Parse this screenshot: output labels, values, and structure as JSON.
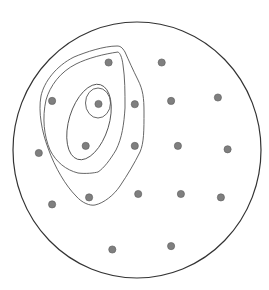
{
  "diagram": {
    "type": "topographic-contour-map",
    "background": "#ffffff",
    "boundary": {
      "shape": "ellipse",
      "cx": 137,
      "cy": 150,
      "rx": 124,
      "ry": 128,
      "stroke": "#333333"
    },
    "contour_color": "#555555",
    "contours": [
      {
        "level": 1,
        "path": "M117,46 C104,46 86,52 74,57 C56,66 44,82 41,96 C38,112 42,132 48,148 C55,168 66,186 76,196 C82,203 90,206 95,205 C104,203 114,195 120,186 C128,174 134,164 140,152 C144,143 144,130 144,112 C144,98 143,90 138,80 C133,70 129,61 125,52 C122,47 120,46 117,46 Z"
      },
      {
        "level": 2,
        "path": "M118,52 C104,54 88,58 76,64 C60,72 50,86 46,100 C42,118 44,136 50,150 C56,162 66,170 78,173 C86,174 94,173 98,172 C104,168 110,160 116,150 C122,138 124,124 125,108 C125,92 125,78 123,65 C122,57 120,53 118,52 Z"
      },
      {
        "level": 3,
        "ellipse": {
          "cx": 89,
          "cy": 122,
          "rx": 20,
          "ry": 39,
          "rotate": 17
        }
      },
      {
        "level": 4,
        "ellipse": {
          "cx": 98,
          "cy": 103,
          "rx": 12.5,
          "ry": 15,
          "rotate": 0
        }
      }
    ],
    "points": [
      {
        "x": 108.6,
        "y": 62.5
      },
      {
        "x": 161.7,
        "y": 62.5
      },
      {
        "x": 52.1,
        "y": 100.9
      },
      {
        "x": 98.5,
        "y": 104.0
      },
      {
        "x": 134.8,
        "y": 104.2
      },
      {
        "x": 171.1,
        "y": 100.9
      },
      {
        "x": 217.9,
        "y": 97.5
      },
      {
        "x": 38.8,
        "y": 153.0
      },
      {
        "x": 85.7,
        "y": 145.9
      },
      {
        "x": 134.8,
        "y": 145.9
      },
      {
        "x": 177.9,
        "y": 145.9
      },
      {
        "x": 227.6,
        "y": 149.3
      },
      {
        "x": 52.1,
        "y": 204.4
      },
      {
        "x": 89.1,
        "y": 197.4
      },
      {
        "x": 138.2,
        "y": 194.0
      },
      {
        "x": 180.9,
        "y": 194.0
      },
      {
        "x": 220.9,
        "y": 197.4
      },
      {
        "x": 112.3,
        "y": 249.5
      },
      {
        "x": 171.1,
        "y": 246.1
      }
    ],
    "point_style": {
      "r": 3.6,
      "fill": "#7f7f7f",
      "stroke": "#5a5a5a"
    }
  }
}
